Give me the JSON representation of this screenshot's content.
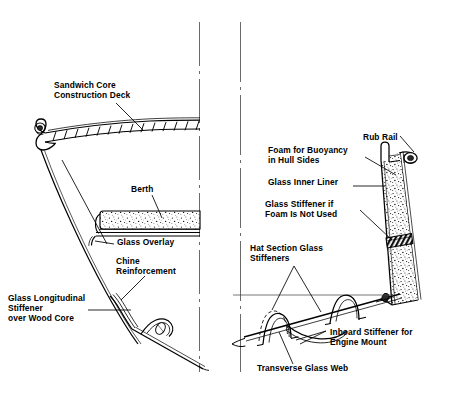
{
  "figure": {
    "panels": [
      "left-hull-section",
      "right-hull-section"
    ],
    "line_color": "#000000",
    "fill_color": "#ffffff",
    "stipple_color": "#1a1a1a",
    "background": "#ffffff"
  },
  "labels": {
    "sandwich_core_deck": "Sandwich Core\nConstruction Deck",
    "berth": "Berth",
    "glass_overlay": "Glass Overlay",
    "chine_reinforcement": "Chine\nReinforcement",
    "glass_longitudinal_stiffener": "Glass Longitudinal\nStiffener\nover Wood Core",
    "rub_rail": "Rub Rail",
    "foam_for_buoyancy": "Foam for Buoyancy\nin Hull Sides",
    "glass_inner_liner": "Glass Inner Liner",
    "glass_stiffener_if_foam": "Glass Stiffener if\nFoam Is Not Used",
    "hat_section_glass_stiffeners": "Hat Section Glass\nStiffeners",
    "inboard_stiffener_engine_mount": "Inboard Stiffener for\nEngine Mount",
    "transverse_glass_web": "Transverse Glass Web"
  }
}
